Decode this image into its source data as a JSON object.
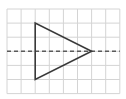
{
  "diagram": {
    "type": "geometry-grid",
    "colors": {
      "background": "#ffffff",
      "grid": "#d4d4d4",
      "triangle": "#3a3a3a",
      "axis": "#5a5a5a"
    },
    "grid": {
      "origin_x": 7,
      "origin_y": 9,
      "cell": 14.1,
      "columns": 8,
      "rows": 6
    },
    "triangle": {
      "vertices_grid": [
        [
          2,
          1
        ],
        [
          2,
          5
        ],
        [
          6,
          3
        ]
      ]
    },
    "symmetry_axis": {
      "style": "dashed",
      "row": 3
    }
  }
}
